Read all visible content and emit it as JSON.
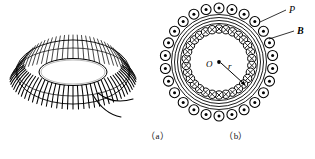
{
  "figure": {
    "background_color": "#ffffff",
    "ink_color": "#000000",
    "width": 315,
    "height": 159
  },
  "panel_a": {
    "caption": "（a）",
    "description": "Perspective drawing of a toroidal coil wound with many closely spaced turns of wire, with two lead wires emerging at the lower right.",
    "element_names": {
      "torus": "toroid-body",
      "windings": "coil-windings",
      "leads": "lead-wires"
    },
    "turns_drawn": 72,
    "lead_count": 2
  },
  "panel_b": {
    "caption": "（b）",
    "description": "Cross-sectional view of the toroid showing the winding turns as small circles: dots on the outer ring (current out of the page) and crosses on the inner ring (current into the page), with concentric core circles, centre O and radius r.",
    "labels": {
      "winding_point": "P",
      "field": "B",
      "centre": "O",
      "radius": "r"
    },
    "outer_turn_count": 26,
    "inner_turn_count": 30,
    "outer_symbol": "dot",
    "inner_symbol": "cross",
    "outer_symbol_meaning": "current out of page",
    "inner_symbol_meaning": "current into page",
    "concentric_circle_count": 4,
    "element_names": {
      "outer_circles": "outer-winding-dot-circles",
      "inner_circles": "inner-winding-cross-circles",
      "core_rings": "concentric-core-rings",
      "radius_arrow": "radius-arrow",
      "centre_dot": "centre-point-dot",
      "leader_P": "leader-line-p",
      "leader_B": "leader-line-b"
    }
  }
}
